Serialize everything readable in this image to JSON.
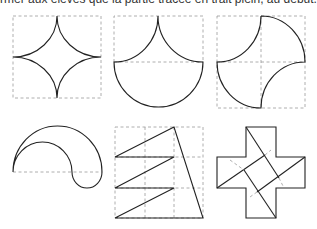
{
  "caption": "rmer aux élèves que la partie tracée en trait plein, au début.",
  "figures": [
    {
      "id": 1,
      "name": "astroid-in-square"
    },
    {
      "id": 2,
      "name": "cusp-with-semicircle"
    },
    {
      "id": 3,
      "name": "quarter-arcs-square"
    },
    {
      "id": 4,
      "name": "nested-semicircles"
    },
    {
      "id": 5,
      "name": "zigzag-triangle-grid"
    },
    {
      "id": 6,
      "name": "cross-with-inner-square"
    }
  ],
  "colors": {
    "solid": "#222222",
    "dashed": "#9a9a9a"
  }
}
